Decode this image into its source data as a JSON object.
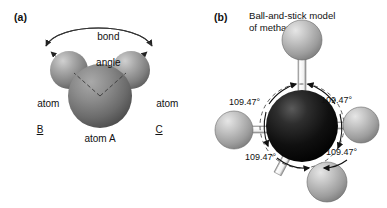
{
  "figure": {
    "background_color": "#ffffff",
    "panels": [
      {
        "tag": "(a)",
        "title": "",
        "annotations": {
          "bond_angle_label_line1": "bond",
          "bond_angle_label_line2": "angle",
          "atom_b_line1": "atom",
          "atom_b_line2": "B",
          "atom_c_line1": "atom",
          "atom_c_line2": "C",
          "atom_a_label": "atom A"
        },
        "atoms": [
          {
            "name": "atom A",
            "letter": "",
            "role": "central",
            "color": "#6e6e6e"
          },
          {
            "name": "atom B",
            "letter": "",
            "role": "terminal",
            "color": "#8a8a8a"
          },
          {
            "name": "atom C",
            "letter": "",
            "role": "terminal",
            "color": "#8a8a8a"
          }
        ]
      },
      {
        "tag": "(b)",
        "title_line1": "Ball-and-stick model",
        "title_line2": "of methane",
        "angles": [
          {
            "id": "top-left",
            "value": "109.47°"
          },
          {
            "id": "top-right",
            "value": "109.47°"
          },
          {
            "id": "bottom-left",
            "value": "109.47°"
          },
          {
            "id": "bottom-right",
            "value": "109.47°"
          }
        ],
        "atoms": [
          {
            "name": "carbon",
            "letter": "C",
            "color": "#0d0d0d"
          },
          {
            "name": "hydrogen-top",
            "letter": "H",
            "color": "#b9b9b9"
          },
          {
            "name": "hydrogen-left",
            "letter": "H",
            "color": "#b9b9b9"
          },
          {
            "name": "hydrogen-right",
            "letter": "H",
            "color": "#b9b9b9"
          },
          {
            "name": "hydrogen-bottom",
            "letter": "H",
            "color": "#b9b9b9"
          }
        ]
      }
    ]
  },
  "colors": {
    "central_atom_gray": "#6e6e6e",
    "terminal_atom_gray": "#8a8a8a",
    "carbon_black": "#0d0d0d",
    "hydrogen_gray": "#b9b9b9",
    "text": "#111111",
    "bond_stick": "#f2f2f2"
  }
}
